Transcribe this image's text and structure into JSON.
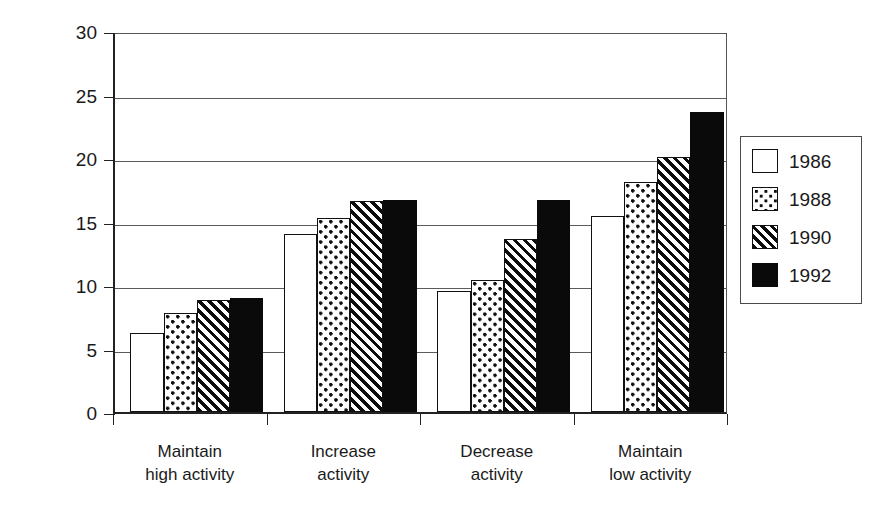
{
  "chart_data": {
    "type": "bar",
    "title": "",
    "subtitle": "",
    "xlabel": "",
    "ylabel": "Percent BMI ≥ 27.8 kg/m",
    "ylim": [
      0,
      30
    ],
    "yticks": [
      0,
      5,
      10,
      15,
      20,
      25,
      30
    ],
    "ytick_labels": [
      "0",
      "5",
      "10",
      "15",
      "20",
      "25",
      "30"
    ],
    "grid": true,
    "grid_axis": "y",
    "legend_position": "right-outside",
    "orientation": "vertical",
    "categories": [
      "Maintain high activity",
      "Increase activity",
      "Decrease activity",
      "Maintain low activity"
    ],
    "category_lines": [
      [
        "Maintain",
        "high activity"
      ],
      [
        "Increase",
        "activity"
      ],
      [
        "Decrease",
        "activity"
      ],
      [
        "Maintain",
        "low activity"
      ]
    ],
    "series": [
      {
        "name": "1986",
        "fill": "white",
        "color": "#ffffff",
        "values": [
          6.2,
          14.0,
          9.5,
          15.4
        ]
      },
      {
        "name": "1988",
        "fill": "dotted",
        "color": "#ffffff",
        "values": [
          7.8,
          15.3,
          10.4,
          18.1
        ]
      },
      {
        "name": "1990",
        "fill": "diagonal-hatch",
        "color": "#ffffff",
        "values": [
          8.8,
          16.6,
          13.6,
          20.1
        ]
      },
      {
        "name": "1992",
        "fill": "solid",
        "color": "#0a0a0a",
        "values": [
          9.0,
          16.7,
          16.7,
          23.6
        ]
      }
    ],
    "annotations": []
  },
  "legend": {
    "entries": [
      {
        "label": "1986",
        "swatch": "empty-square-swatch"
      },
      {
        "label": "1988",
        "swatch": "dotted-square-swatch"
      },
      {
        "label": "1990",
        "swatch": "hatched-square-swatch"
      },
      {
        "label": "1992",
        "swatch": "filled-square-swatch"
      }
    ]
  },
  "axes": {
    "y_title": "Percent BMI ≥ 27.8 kg/m",
    "y_tick_labels": [
      "30",
      "25",
      "20",
      "15",
      "10",
      "5",
      "0"
    ]
  }
}
